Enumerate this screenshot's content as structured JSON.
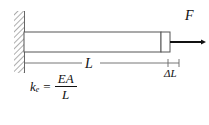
{
  "figure": {
    "type": "engineering-diagram",
    "background_color": "#ffffff",
    "line_color": "#444444",
    "text_color": "#111111"
  },
  "wall": {
    "name": "fixed-support-wall",
    "hatch_color": "#9a9a9a",
    "edge_color": "#555555",
    "x": 14,
    "y": 11,
    "width": 11,
    "height": 62
  },
  "bar": {
    "name": "elastic-bar",
    "x": 24,
    "y": 32,
    "width": 137,
    "height": 20,
    "stroke": "#555555",
    "fill": "#ffffff"
  },
  "end_block": {
    "name": "bar-end-block",
    "x": 161,
    "y": 32,
    "width": 9,
    "height": 20,
    "stroke": "#555555",
    "fill": "#ffffff"
  },
  "force": {
    "label": "F",
    "arrow_color": "#111111",
    "arrow_start_x": 170,
    "arrow_end_x": 206,
    "arrow_y": 42
  },
  "dimension_L": {
    "label": "L",
    "line_y": 63,
    "start_x": 24,
    "end_x": 168,
    "color": "#666666"
  },
  "dimension_delta": {
    "label": "ΔL",
    "line_y": 63,
    "start_x": 168,
    "end_x": 179,
    "color": "#666666"
  },
  "formula": {
    "name": "stiffness-formula",
    "variable": "k",
    "subscript": "e",
    "equals": "=",
    "numerator": "EA",
    "denominator": "L",
    "full_text": "k_e = EA / L"
  },
  "caption": {
    "fragment": ""
  }
}
